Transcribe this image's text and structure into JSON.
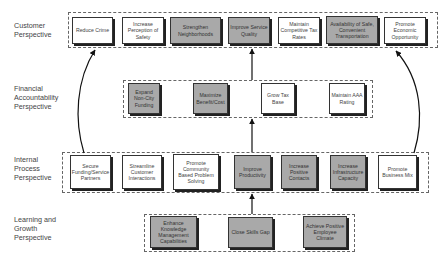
{
  "diagram": {
    "type": "strategy-map",
    "perspectives": [
      {
        "id": "customer",
        "label": "Customer\nPerspective",
        "objectives": [
          {
            "label": "Reduce Crime",
            "style": "white"
          },
          {
            "label": "Increase Perception of Safety",
            "style": "white"
          },
          {
            "label": "Strengthen Neighborhoods",
            "style": "gray"
          },
          {
            "label": "Improve Service Quality",
            "style": "gray"
          },
          {
            "label": "Maintain Competitive Tax Rates",
            "style": "white"
          },
          {
            "label": "Availability of Safe, Convenient Transportation",
            "style": "gray"
          },
          {
            "label": "Promote Economic Opportunity",
            "style": "white"
          }
        ]
      },
      {
        "id": "financial",
        "label": "Financial\nAccountability\nPerspective",
        "objectives": [
          {
            "label": "Expand Non-City Funding",
            "style": "gray"
          },
          {
            "label": "Maximize Benefit/Cost",
            "style": "gray"
          },
          {
            "label": "Grow Tax Base",
            "style": "white"
          },
          {
            "label": "Maintain AAA Rating",
            "style": "white"
          }
        ]
      },
      {
        "id": "internal",
        "label": "Internal\nProcess\nPerspective",
        "objectives": [
          {
            "label": "Secure Funding/Service Partners",
            "style": "white"
          },
          {
            "label": "Streamline Customer Interactions",
            "style": "white"
          },
          {
            "label": "Promote Community Based Problem Solving",
            "style": "white"
          },
          {
            "label": "Improve Productivity",
            "style": "gray"
          },
          {
            "label": "Increase Positive Contacts",
            "style": "gray"
          },
          {
            "label": "Increase Infrastructure Capacity",
            "style": "gray"
          },
          {
            "label": "Promote Business Mix",
            "style": "white"
          }
        ]
      },
      {
        "id": "learning",
        "label": "Learning and\nGrowth\nPerspective",
        "objectives": [
          {
            "label": "Enhance Knowledge Management Capabilities",
            "style": "gray"
          },
          {
            "label": "Close Skills Gap",
            "style": "gray"
          },
          {
            "label": "Achieve Positive Employee Climate",
            "style": "gray"
          }
        ]
      }
    ],
    "arrows": [
      {
        "from": "learning",
        "to": "internal",
        "kind": "straight"
      },
      {
        "from": "internal",
        "to": "financial",
        "kind": "straight"
      },
      {
        "from": "financial",
        "to": "customer",
        "kind": "straight"
      },
      {
        "from": "Secure Funding/Service Partners",
        "to": "customer",
        "kind": "curved-left"
      },
      {
        "from": "Promote Business Mix",
        "to": "customer",
        "kind": "curved-right"
      }
    ],
    "colors": {
      "gray_fill": "#a9a9a9",
      "white_fill": "#ffffff",
      "border": "#333333",
      "text": "#444444"
    }
  },
  "labels": {
    "customer": [
      "Customer",
      "Perspective"
    ],
    "financial": [
      "Financial",
      "Accountability",
      "Perspective"
    ],
    "internal": [
      "Internal",
      "Process",
      "Perspective"
    ],
    "learning": [
      "Learning and",
      "Growth",
      "Perspective"
    ]
  },
  "boxes": {
    "c1": "Reduce Crime",
    "c2": "Increase Perception of Safety",
    "c3": "Strengthen Neighborhoods",
    "c4": "Improve Service Quality",
    "c5": "Maintain Competitive Tax Rates",
    "c6": "Availability of Safe, Convenient Transportation",
    "c7": "Promote Economic Opportunity",
    "f1": "Expand Non-City Funding",
    "f2": "Maximize Benefit/Cost",
    "f3": "Grow Tax Base",
    "f4": "Maintain AAA Rating",
    "i1": "Secure Funding/Service Partners",
    "i2": "Streamline Customer Interactions",
    "i3": "Promote Community Based Problem Solving",
    "i4": "Improve Productivity",
    "i5": "Increase Positive Contacts",
    "i6": "Increase Infrastructure Capacity",
    "i7": "Promote Business Mix",
    "l1": "Enhance Knowledge Management Capabilities",
    "l2": "Close Skills Gap",
    "l3": "Achieve Positive Employee Climate"
  }
}
